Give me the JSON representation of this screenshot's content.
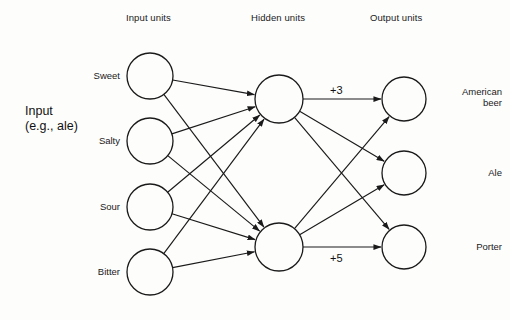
{
  "figure": {
    "type": "neural-network-diagram",
    "background_color": "#fdfdfc",
    "stroke_color": "#1a1a1a"
  },
  "headers": {
    "input": "Input units",
    "hidden": "Hidden units",
    "output": "Output units"
  },
  "side_label": {
    "line1": "Input",
    "line2": "(e.g., ale)"
  },
  "layers": {
    "input": {
      "nodes": [
        {
          "label": "Sweet",
          "cx": 150,
          "cy": 76,
          "r": 23
        },
        {
          "label": "Salty",
          "cx": 150,
          "cy": 141,
          "r": 23
        },
        {
          "label": "Sour",
          "cx": 150,
          "cy": 207,
          "r": 23
        },
        {
          "label": "Bitter",
          "cx": 150,
          "cy": 272,
          "r": 23
        }
      ]
    },
    "hidden": {
      "nodes": [
        {
          "label": "",
          "cx": 279,
          "cy": 99,
          "r": 24
        },
        {
          "label": "",
          "cx": 279,
          "cy": 247,
          "r": 24
        }
      ]
    },
    "output": {
      "nodes": [
        {
          "label": "American\nbeer",
          "label_line1": "American",
          "label_line2": "beer",
          "cx": 404,
          "cy": 99,
          "r": 22
        },
        {
          "label": "Ale",
          "label_line1": "Ale",
          "label_line2": "",
          "cx": 404,
          "cy": 173,
          "r": 22
        },
        {
          "label": "Porter",
          "label_line1": "Porter",
          "label_line2": "",
          "cx": 404,
          "cy": 247,
          "r": 22
        }
      ]
    }
  },
  "edges": {
    "input_to_hidden": [
      {
        "from": 0,
        "to": 0
      },
      {
        "from": 0,
        "to": 1
      },
      {
        "from": 1,
        "to": 0
      },
      {
        "from": 1,
        "to": 1
      },
      {
        "from": 2,
        "to": 0
      },
      {
        "from": 2,
        "to": 1
      },
      {
        "from": 3,
        "to": 0
      },
      {
        "from": 3,
        "to": 1
      }
    ],
    "hidden_to_output": [
      {
        "from": 0,
        "to": 0,
        "weight": "+3"
      },
      {
        "from": 0,
        "to": 1,
        "weight": ""
      },
      {
        "from": 0,
        "to": 2,
        "weight": ""
      },
      {
        "from": 1,
        "to": 0,
        "weight": ""
      },
      {
        "from": 1,
        "to": 1,
        "weight": ""
      },
      {
        "from": 1,
        "to": 2,
        "weight": "+5"
      }
    ]
  },
  "weight_labels": [
    {
      "text": "+3",
      "x": 330,
      "y": 84
    },
    {
      "text": "+5",
      "x": 330,
      "y": 252
    }
  ]
}
